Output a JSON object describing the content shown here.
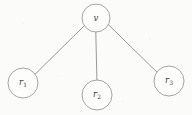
{
  "figure": {
    "type": "graph-diagram",
    "canvas": {
      "width": 192,
      "height": 115,
      "background_color": "#fbfbf9"
    },
    "style": {
      "node_fill_color": "#fdfdfc",
      "node_stroke_color": "#9a9a9a",
      "edge_color": "#8d8d8d",
      "label_color": "#3a3a3a",
      "stroke_width": 0.9
    },
    "nodes": [
      {
        "id": "v",
        "label_main": "v",
        "label_sub": "",
        "cx": 96,
        "cy": 18,
        "r": 14
      },
      {
        "id": "r1",
        "label_main": "r",
        "label_sub": "1",
        "cx": 23,
        "cy": 83,
        "r": 15
      },
      {
        "id": "r2",
        "label_main": "r",
        "label_sub": "2",
        "cx": 97,
        "cy": 95,
        "r": 15
      },
      {
        "id": "r3",
        "label_main": "r",
        "label_sub": "3",
        "cx": 169,
        "cy": 81,
        "r": 15
      }
    ],
    "edges": [
      {
        "id": "edge-v-r1",
        "from": "v",
        "to": "r1",
        "x1": 84.3,
        "y1": 25.7,
        "x2": 34.8,
        "y2": 74.5
      },
      {
        "id": "edge-v-r2",
        "from": "v",
        "to": "r2",
        "x1": 95.8,
        "y1": 32.0,
        "x2": 96.9,
        "y2": 80.0
      },
      {
        "id": "edge-v-r3",
        "from": "v",
        "to": "r3",
        "x1": 108.3,
        "y1": 24.6,
        "x2": 157.8,
        "y2": 73.0
      }
    ]
  }
}
